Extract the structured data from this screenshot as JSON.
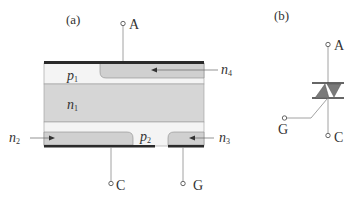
{
  "panel_a": {
    "label": "(a)",
    "terminals": {
      "anode": "A",
      "cathode": "C",
      "gate": "G"
    },
    "regions": {
      "p1": {
        "base": "p",
        "sub": "1"
      },
      "n1": {
        "base": "n",
        "sub": "1"
      },
      "p2": {
        "base": "p",
        "sub": "2"
      },
      "n2": {
        "base": "n",
        "sub": "2"
      },
      "n3": {
        "base": "n",
        "sub": "3"
      },
      "n4": {
        "base": "n",
        "sub": "4"
      }
    }
  },
  "panel_b": {
    "label": "(b)",
    "terminals": {
      "anode": "A",
      "cathode": "C",
      "gate": "G"
    }
  },
  "colors": {
    "grey_region": "#d4d4d4",
    "light_region": "#f4f4f4",
    "metal": "#2a2a2a",
    "line": "#8a8a8a",
    "text": "#333333"
  }
}
